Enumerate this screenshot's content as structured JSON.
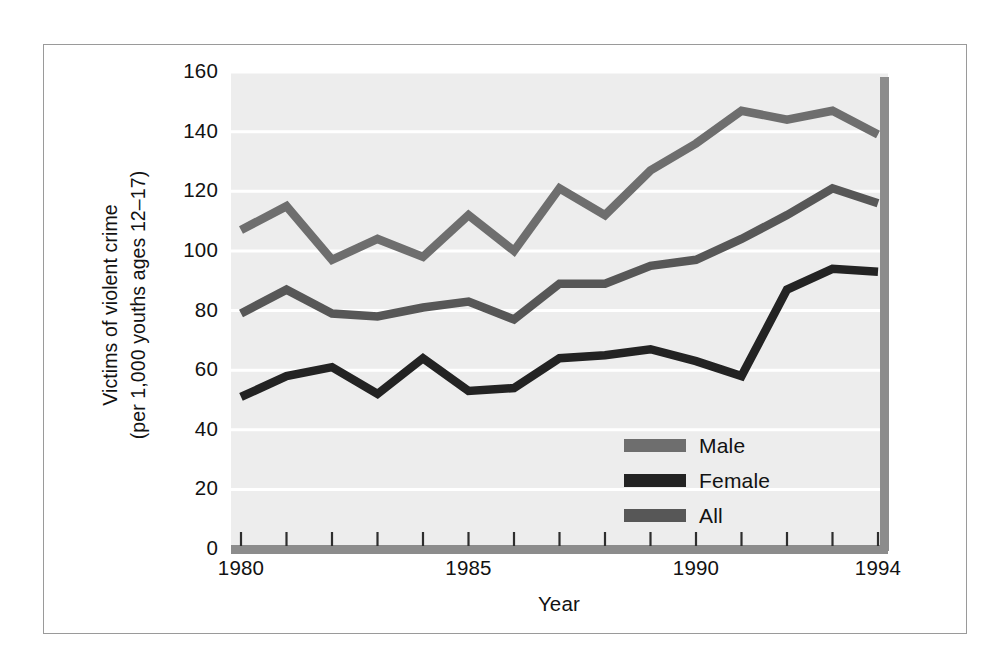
{
  "chart_data": {
    "type": "line",
    "title": "",
    "xlabel": "Year",
    "ylabel": "Victims of violent crime (per 1,000 youths ages 12–17)",
    "ylabel_line1": "Victims of violent crime",
    "ylabel_line2": "(per 1,000 youths ages 12–17)",
    "x": [
      1980,
      1981,
      1982,
      1983,
      1984,
      1985,
      1986,
      1987,
      1988,
      1989,
      1990,
      1991,
      1992,
      1993,
      1994
    ],
    "xlim": [
      1980,
      1994
    ],
    "ylim": [
      0,
      160
    ],
    "yticks": [
      0,
      20,
      40,
      60,
      80,
      100,
      120,
      140,
      160
    ],
    "xticks_major": [
      1980,
      1985,
      1990,
      1994
    ],
    "xtick_labels": [
      "1980",
      "1985",
      "1990",
      "1994"
    ],
    "ytick_labels": [
      "0",
      "20",
      "40",
      "60",
      "80",
      "100",
      "120",
      "140",
      "160"
    ],
    "grid": "horizontal-white",
    "legend_position": "inside-lower-right",
    "series": [
      {
        "name": "Male",
        "color": "#6e6e6e",
        "values": [
          107,
          115,
          97,
          104,
          98,
          112,
          100,
          121,
          112,
          127,
          136,
          147,
          144,
          147,
          139
        ]
      },
      {
        "name": "Female",
        "color": "#232323",
        "values": [
          51,
          58,
          61,
          52,
          64,
          53,
          54,
          64,
          65,
          67,
          63,
          58,
          87,
          94,
          93
        ]
      },
      {
        "name": "All",
        "color": "#575757",
        "values": [
          79,
          87,
          79,
          78,
          81,
          83,
          77,
          89,
          89,
          95,
          97,
          104,
          112,
          121,
          116
        ]
      }
    ]
  },
  "legend": {
    "items": [
      {
        "label": "Male",
        "color": "#6e6e6e"
      },
      {
        "label": "Female",
        "color": "#232323"
      },
      {
        "label": "All",
        "color": "#575757"
      }
    ]
  },
  "axes": {
    "x_title": "Year",
    "y_title_line1": "Victims of violent crime",
    "y_title_line2": "(per 1,000 youths ages 12–17)"
  },
  "style": {
    "plot_background": "#ededed",
    "gridline_color": "#ffffff",
    "axis_color": "#8c8c8c",
    "frame_color": "#9a9a9a",
    "page_background": "#ffffff"
  }
}
